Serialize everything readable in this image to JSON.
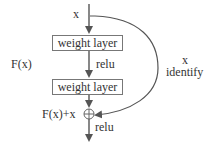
{
  "diagram": {
    "input_label": "x",
    "layers": [
      {
        "label": "weight layer"
      },
      {
        "label": "weight layer"
      }
    ],
    "activation_mid": "relu",
    "activation_out": "relu",
    "residual_label": "F(x)",
    "sum_label": "F(x)+x",
    "shortcut_label_line1": "x",
    "shortcut_label_line2": "identify",
    "sum_symbol": "circle-plus"
  }
}
